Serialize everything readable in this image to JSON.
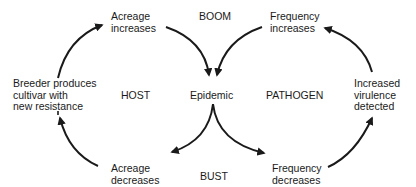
{
  "diagram": {
    "type": "cycle",
    "phase_labels": {
      "top": "BOOM",
      "bottom": "BUST",
      "left": "HOST",
      "right": "PATHOGEN"
    },
    "center": "Epidemic",
    "nodes": {
      "acreage_increases": {
        "line1": "Acreage",
        "line2": "increases"
      },
      "frequency_increases": {
        "line1": "Frequency",
        "line2": "increases"
      },
      "breeder_produces": {
        "line1": "Breeder produces",
        "line2": "cultivar with",
        "line3": "new resistance"
      },
      "increased_virulence": {
        "line1": "Increased",
        "line2": "virulence",
        "line3": "detected"
      },
      "acreage_decreases": {
        "line1": "Acreage",
        "line2": "decreases"
      },
      "frequency_decreases": {
        "line1": "Frequency",
        "line2": "decreases"
      }
    },
    "edges": [
      {
        "from": "Breeder produces cultivar with new resistance",
        "to": "Acreage increases"
      },
      {
        "from": "Acreage increases",
        "to": "Epidemic"
      },
      {
        "from": "Frequency increases",
        "to": "Epidemic"
      },
      {
        "from": "Increased virulence detected",
        "to": "Frequency increases"
      },
      {
        "from": "Epidemic",
        "to": "Acreage decreases"
      },
      {
        "from": "Epidemic",
        "to": "Frequency decreases"
      },
      {
        "from": "Acreage decreases",
        "to": "Breeder produces cultivar with new resistance"
      },
      {
        "from": "Frequency decreases",
        "to": "Increased virulence detected"
      }
    ],
    "colors": {
      "ink": "#1a1a1a",
      "background": "#ffffff"
    }
  }
}
